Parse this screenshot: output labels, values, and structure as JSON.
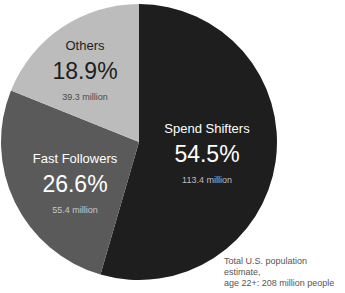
{
  "chart_data": {
    "type": "pie",
    "title": "",
    "slices": [
      {
        "label": "Spend Shifters",
        "percent": 54.5,
        "value_text": "113.4 million",
        "display_pct": "54.5%",
        "color": "#1e1e1e",
        "text_color": "#ffffff",
        "sub_color": "#bdbdbd"
      },
      {
        "label": "Fast Followers",
        "percent": 26.6,
        "value_text": "55.4 million",
        "display_pct": "26.6%",
        "color": "#5a5a5a",
        "text_color": "#ffffff",
        "sub_color": "#c8c8c8"
      },
      {
        "label": "Others",
        "percent": 18.9,
        "value_text": "39.3 million",
        "display_pct": "18.9%",
        "color": "#bcbcbc",
        "text_color": "#1e1e1e",
        "sub_color": "#4a4a4a"
      }
    ],
    "start": "12 o'clock",
    "direction": "clockwise",
    "footnote": [
      "Total U.S. population estimate,",
      "age 22+: 208 million people"
    ]
  }
}
